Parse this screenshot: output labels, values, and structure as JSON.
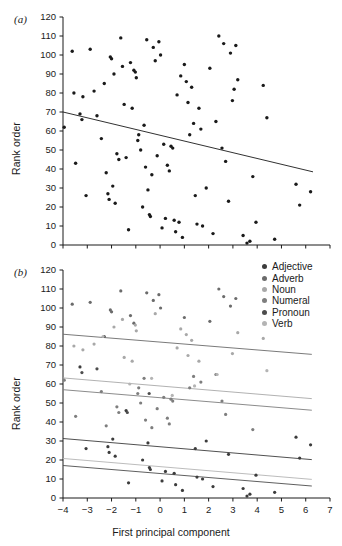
{
  "figure": {
    "panel_a_label": "(a)",
    "panel_b_label": "(b)",
    "y_axis_title": "Rank order",
    "x_axis_title": "First principal component"
  },
  "legend": {
    "items": [
      {
        "label": "Adjective",
        "color": "#3c3c3c"
      },
      {
        "label": "Adverb",
        "color": "#6b6b6b"
      },
      {
        "label": "Noun",
        "color": "#a8a8a8"
      },
      {
        "label": "Numeral",
        "color": "#7e7e7e"
      },
      {
        "label": "Pronoun",
        "color": "#4d4d4d"
      },
      {
        "label": "Verb",
        "color": "#b4b4b4"
      }
    ]
  },
  "chart_data": [
    {
      "type": "scatter",
      "title": "(a)",
      "xlabel": "",
      "ylabel": "Rank order",
      "xlim": [
        -4,
        7
      ],
      "ylim": [
        0,
        120
      ],
      "yticks": [
        0,
        10,
        20,
        30,
        40,
        50,
        60,
        70,
        80,
        90,
        100,
        110,
        120
      ],
      "ytick_labels": [
        "0",
        "10",
        "20",
        "30",
        "40",
        "50",
        "60",
        "70",
        "80",
        "90",
        "100",
        "110",
        "120"
      ],
      "xticks": [
        -4,
        -3,
        -2,
        -1,
        0,
        1,
        2,
        3,
        4,
        5,
        6,
        7
      ],
      "xtick_labels": [],
      "grid": false,
      "legend_position": "none",
      "marker_color": "#1a1a1a",
      "points": [
        [
          -3.95,
          62
        ],
        [
          -3.62,
          102
        ],
        [
          -3.55,
          80
        ],
        [
          -3.48,
          43
        ],
        [
          -3.3,
          69
        ],
        [
          -3.22,
          66
        ],
        [
          -3.18,
          78
        ],
        [
          -3.05,
          26
        ],
        [
          -2.88,
          103
        ],
        [
          -2.72,
          81
        ],
        [
          -2.6,
          68
        ],
        [
          -2.42,
          56
        ],
        [
          -2.3,
          85
        ],
        [
          -2.22,
          38
        ],
        [
          -2.15,
          27
        ],
        [
          -2.1,
          24
        ],
        [
          -2.05,
          99
        ],
        [
          -2.0,
          98
        ],
        [
          -1.95,
          31
        ],
        [
          -1.9,
          90
        ],
        [
          -1.85,
          22
        ],
        [
          -1.78,
          48
        ],
        [
          -1.7,
          45
        ],
        [
          -1.62,
          109
        ],
        [
          -1.55,
          94
        ],
        [
          -1.48,
          74
        ],
        [
          -1.4,
          46
        ],
        [
          -1.3,
          8
        ],
        [
          -1.22,
          96
        ],
        [
          -1.15,
          72
        ],
        [
          -1.08,
          92
        ],
        [
          -1.02,
          91
        ],
        [
          -0.98,
          88
        ],
        [
          -0.92,
          55
        ],
        [
          -0.88,
          58
        ],
        [
          -0.8,
          50
        ],
        [
          -0.72,
          20
        ],
        [
          -0.66,
          63
        ],
        [
          -0.6,
          41
        ],
        [
          -0.55,
          108
        ],
        [
          -0.5,
          29
        ],
        [
          -0.44,
          16
        ],
        [
          -0.4,
          15
        ],
        [
          -0.34,
          37
        ],
        [
          -0.28,
          104
        ],
        [
          -0.2,
          97
        ],
        [
          -0.12,
          47
        ],
        [
          -0.05,
          107
        ],
        [
          0.02,
          100
        ],
        [
          0.08,
          9
        ],
        [
          0.15,
          53
        ],
        [
          0.22,
          14
        ],
        [
          0.3,
          42
        ],
        [
          0.38,
          39
        ],
        [
          0.45,
          52
        ],
        [
          0.52,
          51
        ],
        [
          0.58,
          13
        ],
        [
          0.64,
          7
        ],
        [
          0.7,
          79
        ],
        [
          0.78,
          12
        ],
        [
          0.85,
          89
        ],
        [
          0.92,
          4
        ],
        [
          1.0,
          95
        ],
        [
          1.08,
          86
        ],
        [
          1.15,
          75
        ],
        [
          1.22,
          58
        ],
        [
          1.3,
          83
        ],
        [
          1.38,
          64
        ],
        [
          1.45,
          26
        ],
        [
          1.52,
          11
        ],
        [
          1.6,
          72
        ],
        [
          1.68,
          61
        ],
        [
          1.75,
          10
        ],
        [
          1.9,
          30
        ],
        [
          2.05,
          93
        ],
        [
          2.18,
          6
        ],
        [
          2.3,
          65
        ],
        [
          2.42,
          110
        ],
        [
          2.55,
          51
        ],
        [
          2.62,
          106
        ],
        [
          2.7,
          44
        ],
        [
          2.82,
          23
        ],
        [
          2.9,
          101
        ],
        [
          2.98,
          76
        ],
        [
          3.05,
          82
        ],
        [
          3.12,
          105
        ],
        [
          3.2,
          87
        ],
        [
          3.42,
          5
        ],
        [
          3.58,
          1
        ],
        [
          3.7,
          2
        ],
        [
          3.82,
          36
        ],
        [
          3.95,
          12
        ],
        [
          4.25,
          84
        ],
        [
          4.4,
          67
        ],
        [
          4.72,
          3
        ],
        [
          5.6,
          32
        ],
        [
          5.75,
          21
        ],
        [
          6.2,
          28
        ]
      ],
      "trend_line": {
        "x": [
          -4,
          6.3
        ],
        "y": [
          70,
          38.5
        ],
        "color": "#1a1a1a"
      }
    },
    {
      "type": "scatter",
      "title": "(b)",
      "xlabel": "First principal component",
      "ylabel": "Rank order",
      "xlim": [
        -4,
        7
      ],
      "ylim": [
        0,
        120
      ],
      "yticks": [
        0,
        10,
        20,
        30,
        40,
        50,
        60,
        70,
        80,
        90,
        100,
        110,
        120
      ],
      "ytick_labels": [
        "0",
        "10",
        "20",
        "30",
        "40",
        "50",
        "60",
        "70",
        "80",
        "90",
        "100",
        "110",
        "120"
      ],
      "xticks": [
        -4,
        -3,
        -2,
        -1,
        0,
        1,
        2,
        3,
        4,
        5,
        6,
        7
      ],
      "xtick_labels": [
        "-4",
        "-3",
        "-2",
        "-1",
        "0",
        "1",
        "2",
        "3",
        "4",
        "5",
        "6",
        "7"
      ],
      "grid": false,
      "legend_position": "top-right",
      "series": [
        {
          "name": "Adjective",
          "color": "#3c3c3c",
          "points": [
            [
              -3.3,
              69
            ],
            [
              -3.05,
              26
            ],
            [
              -2.15,
              27
            ],
            [
              -2.1,
              24
            ],
            [
              -1.95,
              31
            ],
            [
              -1.85,
              22
            ],
            [
              -1.4,
              46
            ],
            [
              -1.3,
              8
            ],
            [
              -0.72,
              20
            ],
            [
              -0.5,
              29
            ],
            [
              -0.44,
              16
            ],
            [
              -0.4,
              15
            ],
            [
              0.08,
              9
            ],
            [
              0.22,
              14
            ],
            [
              0.58,
              13
            ],
            [
              0.64,
              7
            ],
            [
              0.92,
              4
            ],
            [
              1.45,
              26
            ],
            [
              1.52,
              11
            ],
            [
              1.75,
              10
            ],
            [
              1.9,
              30
            ],
            [
              2.18,
              6
            ],
            [
              2.82,
              23
            ],
            [
              3.42,
              5
            ],
            [
              3.58,
              1
            ],
            [
              3.7,
              2
            ],
            [
              3.95,
              12
            ],
            [
              4.72,
              3
            ],
            [
              5.6,
              32
            ],
            [
              5.75,
              21
            ],
            [
              6.2,
              28
            ]
          ],
          "trend_line": {
            "x": [
              -4,
              6.25
            ],
            "y": [
              31.3,
              20.2
            ]
          }
        },
        {
          "name": "Adverb",
          "color": "#6b6b6b",
          "points": [
            [
              -3.62,
              102
            ],
            [
              -2.88,
              103
            ],
            [
              -2.05,
              99
            ],
            [
              -2.0,
              98
            ],
            [
              -1.62,
              109
            ],
            [
              -1.22,
              96
            ],
            [
              -1.08,
              92
            ],
            [
              -0.55,
              108
            ],
            [
              -0.28,
              104
            ],
            [
              -0.05,
              107
            ],
            [
              0.02,
              100
            ],
            [
              1.0,
              95
            ],
            [
              2.05,
              93
            ],
            [
              2.42,
              110
            ],
            [
              2.62,
              106
            ],
            [
              2.9,
              101
            ],
            [
              3.12,
              105
            ]
          ],
          "trend_line": {
            "x": [
              -4,
              6.25
            ],
            "y": [
              86.2,
              75.6
            ]
          }
        },
        {
          "name": "Noun",
          "color": "#a8a8a8",
          "points": [
            [
              -3.55,
              80
            ],
            [
              -3.18,
              78
            ],
            [
              -2.72,
              81
            ],
            [
              -1.9,
              90
            ],
            [
              -1.55,
              94
            ],
            [
              -1.48,
              74
            ],
            [
              -1.15,
              72
            ],
            [
              -1.02,
              91
            ],
            [
              -0.98,
              88
            ],
            [
              -0.2,
              97
            ],
            [
              0.7,
              79
            ],
            [
              0.85,
              89
            ],
            [
              1.08,
              86
            ],
            [
              1.15,
              75
            ],
            [
              1.3,
              83
            ],
            [
              1.6,
              72
            ],
            [
              2.98,
              76
            ],
            [
              3.2,
              87
            ],
            [
              4.25,
              84
            ]
          ],
          "trend_line": {
            "x": [
              -4,
              6.25
            ],
            "y": [
              63.2,
              52.3
            ]
          }
        },
        {
          "name": "Numeral",
          "color": "#7e7e7e",
          "points": [
            [
              -3.95,
              62
            ],
            [
              -3.48,
              43
            ],
            [
              -2.42,
              56
            ],
            [
              -2.22,
              38
            ],
            [
              -1.78,
              48
            ],
            [
              -1.7,
              45
            ],
            [
              -0.92,
              55
            ],
            [
              -0.88,
              58
            ],
            [
              -0.8,
              50
            ],
            [
              -0.66,
              63
            ],
            [
              -0.6,
              41
            ],
            [
              -0.34,
              37
            ],
            [
              -0.12,
              47
            ],
            [
              0.15,
              53
            ],
            [
              0.3,
              42
            ],
            [
              0.38,
              39
            ],
            [
              0.45,
              52
            ],
            [
              0.52,
              51
            ],
            [
              1.22,
              58
            ],
            [
              1.38,
              64
            ],
            [
              1.68,
              61
            ],
            [
              2.3,
              65
            ],
            [
              2.55,
              51
            ],
            [
              2.7,
              44
            ],
            [
              3.82,
              36
            ]
          ],
          "trend_line": {
            "x": [
              -4,
              6.25
            ],
            "y": [
              57.0,
              46.2
            ]
          }
        },
        {
          "name": "Pronoun",
          "color": "#4d4d4d",
          "points": [
            [
              -3.22,
              66
            ],
            [
              -2.6,
              68
            ],
            [
              -2.3,
              85
            ],
            [
              -1.35,
              45
            ],
            [
              -0.45,
              55
            ]
          ],
          "trend_line": {
            "x": [
              -4,
              6.25
            ],
            "y": [
              17.1,
              6.3
            ]
          }
        },
        {
          "name": "Verb",
          "color": "#b4b4b4",
          "points": [
            [
              -2.35,
              85
            ],
            [
              -1.25,
              60
            ],
            [
              -0.35,
              63
            ],
            [
              0.5,
              54
            ],
            [
              1.42,
              59
            ],
            [
              2.35,
              65
            ],
            [
              4.4,
              67
            ]
          ],
          "trend_line": {
            "x": [
              -4,
              6.25
            ],
            "y": [
              20.8,
              9.8
            ]
          }
        }
      ]
    }
  ]
}
